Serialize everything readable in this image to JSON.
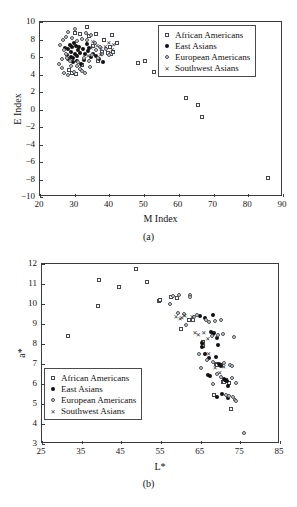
{
  "figure": {
    "panels": [
      {
        "id": "a",
        "caption": "(a)",
        "chart_data": {
          "type": "scatter",
          "title": "",
          "xlabel": "M Index",
          "ylabel": "E Index",
          "xlim": [
            20,
            90
          ],
          "ylim": [
            -10,
            10
          ],
          "xticks": [
            20,
            30,
            40,
            50,
            60,
            70,
            80,
            90
          ],
          "yticks": [
            -10,
            -8,
            -6,
            -4,
            -2,
            0,
            2,
            4,
            6,
            8,
            10
          ],
          "grid": false,
          "legend_position": "upper-right",
          "series": [
            {
              "name": "African Americans",
              "marker": "open-square",
              "points": [
                [
                  33.4,
                  9.4
                ],
                [
                  36.2,
                  8.6
                ],
                [
                  40.6,
                  8.5
                ],
                [
                  42.3,
                  7.6
                ],
                [
                  38.4,
                  7.9
                ],
                [
                  40.2,
                  7.1
                ],
                [
                  40.5,
                  6.4
                ],
                [
                  37.8,
                  6.6
                ],
                [
                  35.4,
                  7.3
                ],
                [
                  34.0,
                  8.4
                ],
                [
                  31.6,
                  8.6
                ],
                [
                  30.2,
                  8.8
                ],
                [
                  39.5,
                  6.5
                ],
                [
                  41.0,
                  6.6
                ],
                [
                  36.6,
                  5.6
                ],
                [
                  48.2,
                  5.3
                ],
                [
                  50.3,
                  5.6
                ],
                [
                  52.8,
                  4.3
                ],
                [
                  62.0,
                  1.3
                ],
                [
                  65.5,
                  0.5
                ],
                [
                  66.6,
                  -0.8
                ],
                [
                  85.8,
                  -7.8
                ],
                [
                  29.1,
                  4.2
                ],
                [
                  30.4,
                  4.1
                ],
                [
                  28.4,
                  4.5
                ],
                [
                  32.0,
                  5.1
                ]
              ]
            },
            {
              "name": "East Asians",
              "marker": "filled-circle",
              "points": [
                [
                  28.6,
                  7.4
                ],
                [
                  29.2,
                  7.2
                ],
                [
                  29.8,
                  7.6
                ],
                [
                  30.4,
                  7.3
                ],
                [
                  28.0,
                  6.9
                ],
                [
                  29.0,
                  6.6
                ],
                [
                  30.0,
                  6.4
                ],
                [
                  31.0,
                  6.8
                ],
                [
                  27.8,
                  6.2
                ],
                [
                  28.8,
                  6.0
                ],
                [
                  29.6,
                  5.9
                ],
                [
                  30.8,
                  6.1
                ],
                [
                  31.6,
                  6.5
                ],
                [
                  32.4,
                  6.9
                ],
                [
                  33.0,
                  6.3
                ],
                [
                  33.8,
                  6.7
                ],
                [
                  31.2,
                  7.1
                ],
                [
                  30.6,
                  5.6
                ],
                [
                  29.4,
                  5.4
                ],
                [
                  28.2,
                  5.8
                ],
                [
                  32.8,
                  5.7
                ],
                [
                  34.6,
                  6.0
                ],
                [
                  35.4,
                  6.4
                ],
                [
                  36.2,
                  6.1
                ],
                [
                  27.2,
                  7.0
                ],
                [
                  33.4,
                  7.5
                ],
                [
                  34.2,
                  7.0
                ],
                [
                  31.8,
                  5.2
                ],
                [
                  37.0,
                  5.8
                ],
                [
                  38.2,
                  5.4
                ]
              ]
            },
            {
              "name": "European Americans",
              "marker": "open-circle",
              "points": [
                [
                  26.6,
                  8.0
                ],
                [
                  27.4,
                  8.3
                ],
                [
                  28.2,
                  8.9
                ],
                [
                  30.0,
                  9.2
                ],
                [
                  33.2,
                  8.8
                ],
                [
                  34.8,
                  8.5
                ],
                [
                  25.8,
                  7.4
                ],
                [
                  26.8,
                  6.8
                ],
                [
                  27.6,
                  6.4
                ],
                [
                  26.2,
                  5.8
                ],
                [
                  25.6,
                  5.2
                ],
                [
                  26.4,
                  4.8
                ],
                [
                  27.0,
                  4.2
                ],
                [
                  28.0,
                  4.0
                ],
                [
                  29.8,
                  4.3
                ],
                [
                  31.4,
                  4.6
                ],
                [
                  30.8,
                  5.0
                ],
                [
                  32.2,
                  4.4
                ],
                [
                  29.0,
                  5.0
                ],
                [
                  28.6,
                  5.5
                ],
                [
                  27.8,
                  5.9
                ],
                [
                  31.0,
                  5.4
                ],
                [
                  32.6,
                  5.9
                ],
                [
                  34.0,
                  5.5
                ],
                [
                  35.0,
                  6.2
                ],
                [
                  36.0,
                  6.8
                ],
                [
                  37.2,
                  7.2
                ],
                [
                  35.8,
                  7.6
                ],
                [
                  33.6,
                  7.9
                ],
                [
                  32.0,
                  8.1
                ],
                [
                  30.6,
                  7.8
                ],
                [
                  29.2,
                  8.2
                ],
                [
                  38.0,
                  6.3
                ],
                [
                  39.0,
                  6.9
                ],
                [
                  40.0,
                  6.2
                ],
                [
                  36.8,
                  5.9
                ],
                [
                  34.4,
                  4.9
                ],
                [
                  33.0,
                  4.2
                ]
              ]
            },
            {
              "name": "Southwest Asians",
              "marker": "x",
              "points": [
                [
                  35.2,
                  7.8
                ],
                [
                  36.4,
                  7.4
                ],
                [
                  37.6,
                  7.0
                ],
                [
                  38.8,
                  7.3
                ],
                [
                  39.8,
                  7.7
                ],
                [
                  41.2,
                  7.5
                ],
                [
                  40.8,
                  6.9
                ],
                [
                  34.6,
                  7.1
                ],
                [
                  33.8,
                  6.2
                ],
                [
                  37.4,
                  6.3
                ]
              ]
            }
          ]
        }
      },
      {
        "id": "b",
        "caption": "(b)",
        "chart_data": {
          "type": "scatter",
          "title": "",
          "xlabel": "L*",
          "ylabel": "a*",
          "xlim": [
            25,
            85
          ],
          "ylim": [
            3,
            12
          ],
          "xticks": [
            25,
            35,
            45,
            55,
            65,
            75,
            85
          ],
          "yticks": [
            3,
            4,
            5,
            6,
            7,
            8,
            9,
            10,
            11,
            12
          ],
          "grid": false,
          "legend_position": "lower-left",
          "series": [
            {
              "name": "African Americans",
              "marker": "open-square",
              "points": [
                [
                  31.5,
                  8.4
                ],
                [
                  39.2,
                  9.9
                ],
                [
                  39.4,
                  11.2
                ],
                [
                  44.3,
                  10.85
                ],
                [
                  48.8,
                  11.75
                ],
                [
                  51.5,
                  11.1
                ],
                [
                  54.4,
                  10.15
                ],
                [
                  54.8,
                  10.2
                ],
                [
                  57.6,
                  10.35
                ],
                [
                  59.0,
                  10.3
                ],
                [
                  62.0,
                  9.2
                ],
                [
                  63.0,
                  9.2
                ],
                [
                  60.0,
                  8.75
                ],
                [
                  65.6,
                  8.1
                ],
                [
                  65.6,
                  7.9
                ],
                [
                  68.8,
                  7.0
                ],
                [
                  69.2,
                  6.95
                ],
                [
                  70.0,
                  6.95
                ],
                [
                  70.6,
                  6.1
                ],
                [
                  71.0,
                  6.1
                ],
                [
                  71.4,
                  6.2
                ],
                [
                  72.2,
                  6.05
                ],
                [
                  68.4,
                  5.45
                ],
                [
                  72.6,
                  4.75
                ]
              ]
            },
            {
              "name": "East Asians",
              "marker": "filled-circle",
              "points": [
                [
                  65.4,
                  8.05
                ],
                [
                  65.4,
                  7.85
                ],
                [
                  66.2,
                  7.5
                ],
                [
                  67.0,
                  7.3
                ],
                [
                  67.6,
                  8.6
                ],
                [
                  68.0,
                  8.5
                ],
                [
                  68.4,
                  8.55
                ],
                [
                  68.2,
                  9.45
                ],
                [
                  69.0,
                  8.3
                ],
                [
                  69.4,
                  7.95
                ],
                [
                  68.8,
                  7.35
                ],
                [
                  69.6,
                  7.0
                ],
                [
                  69.8,
                  6.95
                ],
                [
                  70.2,
                  6.9
                ],
                [
                  66.8,
                  6.45
                ],
                [
                  67.4,
                  6.4
                ],
                [
                  70.8,
                  6.25
                ],
                [
                  71.2,
                  6.2
                ],
                [
                  71.6,
                  6.15
                ],
                [
                  64.8,
                  9.4
                ],
                [
                  66.0,
                  9.3
                ],
                [
                  72.0,
                  5.9
                ],
                [
                  70.4,
                  5.5
                ],
                [
                  69.2,
                  5.35
                ],
                [
                  71.8,
                  5.3
                ]
              ]
            },
            {
              "name": "European Americans",
              "marker": "open-circle",
              "points": [
                [
                  58.0,
                  10.4
                ],
                [
                  59.6,
                  10.45
                ],
                [
                  62.2,
                  10.45
                ],
                [
                  62.4,
                  10.35
                ],
                [
                  60.8,
                  9.5
                ],
                [
                  63.2,
                  9.35
                ],
                [
                  61.4,
                  8.95
                ],
                [
                  64.2,
                  9.45
                ],
                [
                  66.4,
                  9.2
                ],
                [
                  67.2,
                  9.1
                ],
                [
                  68.6,
                  9.15
                ],
                [
                  70.0,
                  9.2
                ],
                [
                  67.8,
                  8.4
                ],
                [
                  69.4,
                  8.45
                ],
                [
                  70.6,
                  8.5
                ],
                [
                  73.4,
                  8.35
                ],
                [
                  64.6,
                  7.5
                ],
                [
                  66.6,
                  7.2
                ],
                [
                  68.0,
                  7.1
                ],
                [
                  71.0,
                  7.05
                ],
                [
                  72.4,
                  6.95
                ],
                [
                  73.0,
                  6.9
                ],
                [
                  65.0,
                  6.8
                ],
                [
                  69.0,
                  6.5
                ],
                [
                  70.2,
                  6.35
                ],
                [
                  72.8,
                  6.3
                ],
                [
                  73.8,
                  6.05
                ],
                [
                  68.2,
                  6.0
                ],
                [
                  71.4,
                  5.45
                ],
                [
                  72.2,
                  5.4
                ],
                [
                  73.2,
                  5.35
                ],
                [
                  73.6,
                  5.2
                ],
                [
                  74.0,
                  5.15
                ],
                [
                  75.8,
                  3.55
                ],
                [
                  57.2,
                  10.0
                ],
                [
                  59.2,
                  9.55
                ]
              ]
            },
            {
              "name": "Southwest Asians",
              "marker": "x",
              "points": [
                [
                  58.8,
                  9.4
                ],
                [
                  60.2,
                  9.35
                ],
                [
                  61.0,
                  9.45
                ],
                [
                  62.8,
                  9.4
                ],
                [
                  63.6,
                  8.6
                ],
                [
                  64.4,
                  8.5
                ],
                [
                  65.8,
                  8.6
                ],
                [
                  66.8,
                  8.3
                ],
                [
                  67.0,
                  7.55
                ],
                [
                  68.6,
                  6.85
                ],
                [
                  69.8,
                  6.6
                ],
                [
                  70.8,
                  6.9
                ],
                [
                  59.8,
                  9.3
                ]
              ]
            }
          ]
        }
      }
    ]
  }
}
